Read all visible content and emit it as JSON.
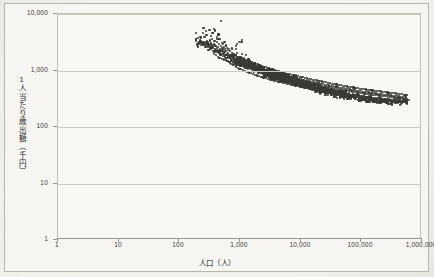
{
  "chart_data": {
    "type": "scatter",
    "title": "",
    "xlabel": "人口（人）",
    "ylabel": "1人当たり歳出額（千円）",
    "xscale": "log",
    "yscale": "log",
    "xlim": [
      1,
      1000000
    ],
    "ylim": [
      1,
      10000
    ],
    "grid": true,
    "legend": "none",
    "marker_color": "#3a3936",
    "plot_background": "#f9f8f4",
    "gridline_color": "#cfcbc2",
    "xticks": [
      "1",
      "10",
      "100",
      "1,000",
      "10,000",
      "100,000",
      "1,000,000"
    ],
    "xtick_values": [
      1,
      10,
      100,
      1000,
      10000,
      100000,
      1000000
    ],
    "yticks": [
      "1",
      "10",
      "100",
      "1,000",
      "10,000"
    ],
    "ytick_values": [
      1,
      10,
      100,
      1000,
      10000
    ],
    "point_count": 1750,
    "trend": {
      "x_points": [
        180,
        400,
        1000,
        3000,
        10000,
        30000,
        100000,
        300000,
        600000
      ],
      "y_points": [
        3600,
        2400,
        1450,
        900,
        600,
        420,
        320,
        275,
        290
      ]
    },
    "points": [
      [
        186,
        4600
      ],
      [
        212,
        2950
      ],
      [
        232,
        3050
      ],
      [
        252,
        3900
      ],
      [
        268,
        2880
      ],
      [
        281,
        4250
      ],
      [
        292,
        3180
      ],
      [
        300,
        2600
      ],
      [
        311,
        5250
      ],
      [
        318,
        3400
      ],
      [
        326,
        2420
      ],
      [
        334,
        4050
      ],
      [
        341,
        2780
      ],
      [
        349,
        3560
      ],
      [
        356,
        2180
      ],
      [
        362,
        4600
      ],
      [
        369,
        2950
      ],
      [
        375,
        1980
      ],
      [
        381,
        3350
      ],
      [
        388,
        5100
      ],
      [
        394,
        2300
      ],
      [
        400,
        2750
      ],
      [
        406,
        1870
      ],
      [
        412,
        3900
      ],
      [
        418,
        2480
      ],
      [
        424,
        3150
      ],
      [
        430,
        1760
      ],
      [
        436,
        2620
      ],
      [
        442,
        4350
      ],
      [
        448,
        2080
      ],
      [
        454,
        2900
      ],
      [
        460,
        1680
      ],
      [
        466,
        2350
      ],
      [
        472,
        3600
      ],
      [
        478,
        1920
      ],
      [
        484,
        2700
      ],
      [
        490,
        7450
      ],
      [
        496,
        2220
      ],
      [
        502,
        1620
      ],
      [
        508,
        3050
      ],
      [
        514,
        2480
      ],
      [
        520,
        1820
      ],
      [
        526,
        2900
      ],
      [
        532,
        2150
      ],
      [
        538,
        1560
      ],
      [
        544,
        2620
      ],
      [
        550,
        1980
      ],
      [
        556,
        3200
      ],
      [
        562,
        1720
      ],
      [
        568,
        2380
      ],
      [
        574,
        1880
      ],
      [
        580,
        2760
      ],
      [
        586,
        1520
      ],
      [
        592,
        2180
      ],
      [
        598,
        1680
      ],
      [
        604,
        2520
      ],
      [
        612,
        1920
      ],
      [
        620,
        1480
      ],
      [
        628,
        2280
      ],
      [
        636,
        1760
      ],
      [
        644,
        2050
      ],
      [
        652,
        1420
      ],
      [
        660,
        2420
      ],
      [
        668,
        1640
      ],
      [
        676,
        1880
      ],
      [
        684,
        1380
      ],
      [
        692,
        2180
      ],
      [
        700,
        1560
      ],
      [
        710,
        1800
      ],
      [
        720,
        1320
      ],
      [
        730,
        2050
      ],
      [
        740,
        1480
      ],
      [
        750,
        1720
      ],
      [
        760,
        1280
      ],
      [
        772,
        1950
      ],
      [
        784,
        1420
      ],
      [
        796,
        1660
      ],
      [
        808,
        1240
      ],
      [
        820,
        1880
      ],
      [
        832,
        1380
      ],
      [
        845,
        1600
      ],
      [
        858,
        1180
      ],
      [
        872,
        1820
      ],
      [
        886,
        1340
      ],
      [
        900,
        1540
      ],
      [
        915,
        1120
      ],
      [
        930,
        1760
      ],
      [
        946,
        1300
      ],
      [
        962,
        1480
      ],
      [
        978,
        1080
      ],
      [
        995,
        1700
      ],
      [
        1012,
        1260
      ],
      [
        1030,
        1440
      ],
      [
        1048,
        1050
      ],
      [
        1067,
        1640
      ],
      [
        1086,
        1220
      ],
      [
        1106,
        1400
      ],
      [
        1126,
        1010
      ],
      [
        1147,
        1580
      ],
      [
        1168,
        1180
      ],
      [
        1190,
        1360
      ],
      [
        1212,
        980
      ],
      [
        1235,
        1520
      ],
      [
        1258,
        1150
      ],
      [
        1282,
        1320
      ],
      [
        1306,
        950
      ],
      [
        1331,
        1480
      ],
      [
        1356,
        1120
      ],
      [
        1382,
        1280
      ],
      [
        1409,
        920
      ],
      [
        1436,
        1440
      ],
      [
        1464,
        1090
      ],
      [
        1492,
        1250
      ],
      [
        1521,
        890
      ],
      [
        1551,
        1400
      ],
      [
        1581,
        1060
      ],
      [
        1612,
        1210
      ],
      [
        1644,
        865
      ],
      [
        1676,
        1360
      ],
      [
        1709,
        1030
      ],
      [
        1743,
        1180
      ],
      [
        1778,
        840
      ],
      [
        1813,
        1320
      ],
      [
        1849,
        1000
      ],
      [
        1886,
        1150
      ],
      [
        1924,
        815
      ],
      [
        1962,
        1280
      ],
      [
        2001,
        975
      ],
      [
        2042,
        1120
      ],
      [
        2083,
        790
      ],
      [
        2125,
        1240
      ],
      [
        2168,
        950
      ],
      [
        2212,
        1090
      ],
      [
        2256,
        770
      ],
      [
        2302,
        1200
      ],
      [
        2349,
        925
      ],
      [
        2396,
        1060
      ],
      [
        2445,
        750
      ],
      [
        2495,
        1170
      ],
      [
        2545,
        900
      ],
      [
        2597,
        1030
      ],
      [
        2650,
        730
      ],
      [
        2704,
        1140
      ],
      [
        2759,
        880
      ],
      [
        2815,
        1000
      ],
      [
        2873,
        710
      ],
      [
        2931,
        1110
      ],
      [
        2991,
        860
      ],
      [
        3052,
        975
      ],
      [
        3114,
        695
      ],
      [
        3178,
        1080
      ],
      [
        3243,
        840
      ],
      [
        3309,
        950
      ],
      [
        3376,
        680
      ],
      [
        3445,
        1050
      ],
      [
        3516,
        820
      ],
      [
        3588,
        925
      ],
      [
        3661,
        665
      ],
      [
        3736,
        1020
      ],
      [
        3812,
        800
      ],
      [
        3890,
        900
      ],
      [
        3970,
        650
      ],
      [
        4051,
        995
      ],
      [
        4134,
        785
      ],
      [
        4219,
        875
      ],
      [
        4305,
        635
      ],
      [
        4393,
        970
      ],
      [
        4483,
        765
      ],
      [
        4575,
        855
      ],
      [
        4669,
        622
      ],
      [
        4765,
        945
      ],
      [
        4862,
        750
      ],
      [
        4962,
        835
      ],
      [
        5064,
        610
      ],
      [
        5167,
        920
      ],
      [
        5273,
        735
      ],
      [
        5381,
        815
      ],
      [
        5491,
        598
      ],
      [
        5604,
        900
      ],
      [
        5718,
        720
      ],
      [
        5836,
        795
      ],
      [
        5955,
        585
      ],
      [
        6077,
        880
      ],
      [
        6202,
        705
      ],
      [
        6329,
        778
      ],
      [
        6459,
        575
      ],
      [
        6591,
        860
      ],
      [
        6726,
        692
      ],
      [
        6864,
        760
      ],
      [
        7005,
        563
      ],
      [
        7148,
        842
      ],
      [
        7295,
        678
      ],
      [
        7444,
        745
      ],
      [
        7597,
        552
      ],
      [
        7752,
        825
      ],
      [
        7911,
        665
      ],
      [
        8073,
        730
      ],
      [
        8238,
        542
      ],
      [
        8407,
        808
      ],
      [
        8579,
        652
      ],
      [
        8754,
        715
      ],
      [
        8933,
        532
      ],
      [
        9116,
        790
      ],
      [
        9302,
        640
      ],
      [
        9492,
        700
      ],
      [
        9686,
        522
      ],
      [
        9884,
        775
      ],
      [
        10086,
        628
      ],
      [
        10292,
        688
      ],
      [
        10502,
        512
      ],
      [
        10716,
        760
      ],
      [
        10935,
        617
      ],
      [
        11158,
        675
      ],
      [
        11385,
        503
      ],
      [
        11617,
        745
      ],
      [
        11854,
        605
      ],
      [
        12096,
        662
      ],
      [
        12342,
        494
      ],
      [
        12594,
        730
      ],
      [
        12850,
        595
      ],
      [
        13112,
        650
      ],
      [
        13379,
        486
      ],
      [
        13652,
        716
      ],
      [
        13930,
        584
      ],
      [
        14214,
        638
      ],
      [
        14503,
        478
      ],
      [
        14799,
        702
      ],
      [
        15100,
        574
      ],
      [
        15408,
        626
      ],
      [
        15722,
        470
      ],
      [
        16042,
        690
      ],
      [
        16369,
        564
      ],
      [
        16703,
        615
      ],
      [
        17043,
        462
      ],
      [
        17390,
        676
      ],
      [
        17745,
        554
      ],
      [
        18106,
        604
      ],
      [
        18475,
        455
      ],
      [
        18852,
        664
      ],
      [
        19236,
        545
      ],
      [
        19628,
        593
      ],
      [
        20028,
        448
      ],
      [
        20436,
        652
      ],
      [
        20852,
        536
      ],
      [
        21277,
        582
      ],
      [
        21710,
        441
      ],
      [
        22152,
        640
      ],
      [
        22603,
        527
      ],
      [
        23063,
        572
      ],
      [
        23533,
        434
      ],
      [
        24012,
        628
      ],
      [
        24500,
        518
      ],
      [
        24999,
        562
      ],
      [
        25507,
        428
      ],
      [
        26026,
        617
      ],
      [
        26556,
        510
      ],
      [
        27096,
        552
      ],
      [
        27647,
        422
      ],
      [
        28210,
        606
      ],
      [
        28784,
        502
      ],
      [
        29369,
        542
      ],
      [
        29967,
        416
      ],
      [
        30577,
        595
      ],
      [
        31199,
        494
      ],
      [
        31834,
        533
      ],
      [
        32482,
        410
      ],
      [
        33143,
        585
      ],
      [
        33818,
        486
      ],
      [
        34506,
        524
      ],
      [
        35208,
        405
      ],
      [
        35925,
        575
      ],
      [
        36656,
        478
      ],
      [
        37402,
        515
      ],
      [
        38163,
        399
      ],
      [
        38940,
        565
      ],
      [
        39733,
        471
      ],
      [
        40541,
        506
      ],
      [
        41366,
        394
      ],
      [
        42208,
        556
      ],
      [
        43067,
        464
      ],
      [
        43944,
        498
      ],
      [
        44838,
        389
      ],
      [
        45751,
        547
      ],
      [
        46682,
        457
      ],
      [
        47632,
        490
      ],
      [
        48601,
        384
      ],
      [
        49590,
        538
      ],
      [
        50599,
        450
      ],
      [
        51629,
        482
      ],
      [
        52679,
        380
      ],
      [
        53751,
        530
      ],
      [
        54845,
        443
      ],
      [
        55961,
        474
      ],
      [
        57100,
        375
      ],
      [
        58262,
        522
      ],
      [
        59448,
        437
      ],
      [
        60657,
        467
      ],
      [
        61892,
        371
      ],
      [
        63152,
        514
      ],
      [
        64437,
        431
      ],
      [
        65749,
        460
      ],
      [
        67087,
        367
      ],
      [
        68453,
        506
      ],
      [
        69847,
        425
      ],
      [
        71269,
        453
      ],
      [
        72720,
        363
      ],
      [
        74201,
        499
      ],
      [
        75712,
        419
      ],
      [
        77254,
        446
      ],
      [
        78827,
        359
      ],
      [
        80433,
        492
      ],
      [
        82071,
        413
      ],
      [
        83743,
        440
      ],
      [
        85448,
        355
      ],
      [
        87189,
        485
      ],
      [
        88965,
        408
      ],
      [
        90777,
        434
      ],
      [
        92625,
        351
      ],
      [
        94512,
        478
      ],
      [
        96436,
        402
      ],
      [
        98400,
        428
      ],
      [
        100403,
        348
      ],
      [
        102448,
        472
      ],
      [
        104533,
        397
      ],
      [
        106661,
        422
      ],
      [
        108832,
        344
      ],
      [
        111047,
        466
      ],
      [
        113307,
        392
      ],
      [
        115613,
        417
      ],
      [
        117966,
        341
      ],
      [
        120366,
        460
      ],
      [
        122816,
        387
      ],
      [
        125315,
        412
      ],
      [
        127865,
        338
      ],
      [
        130467,
        455
      ],
      [
        133122,
        382
      ],
      [
        135831,
        407
      ],
      [
        138595,
        334
      ],
      [
        141415,
        449
      ],
      [
        144293,
        377
      ],
      [
        147229,
        402
      ],
      [
        150225,
        331
      ],
      [
        153282,
        444
      ],
      [
        156401,
        373
      ],
      [
        159584,
        397
      ],
      [
        162832,
        328
      ],
      [
        166146,
        439
      ],
      [
        169527,
        368
      ],
      [
        172977,
        392
      ],
      [
        176497,
        325
      ],
      [
        180089,
        434
      ],
      [
        183754,
        364
      ],
      [
        187493,
        388
      ],
      [
        191308,
        322
      ],
      [
        195201,
        429
      ],
      [
        199173,
        360
      ],
      [
        203225,
        383
      ],
      [
        207360,
        319
      ],
      [
        211579,
        424
      ],
      [
        215883,
        356
      ],
      [
        220275,
        378
      ],
      [
        224755,
        316
      ],
      [
        229327,
        419
      ],
      [
        233991,
        352
      ],
      [
        238750,
        374
      ],
      [
        243606,
        313
      ],
      [
        248560,
        414
      ],
      [
        253615,
        348
      ],
      [
        258772,
        370
      ],
      [
        264034,
        310
      ],
      [
        269403,
        409
      ],
      [
        274881,
        344
      ],
      [
        280470,
        366
      ],
      [
        286173,
        307
      ],
      [
        291992,
        405
      ],
      [
        297929,
        340
      ],
      [
        303986,
        362
      ],
      [
        310167,
        305
      ],
      [
        316473,
        400
      ],
      [
        322907,
        336
      ],
      [
        329472,
        358
      ],
      [
        336170,
        302
      ],
      [
        343004,
        396
      ],
      [
        349977,
        332
      ],
      [
        357092,
        354
      ],
      [
        364351,
        299
      ],
      [
        371758,
        391
      ],
      [
        379316,
        328
      ],
      [
        387027,
        350
      ],
      [
        394895,
        297
      ],
      [
        402923,
        387
      ],
      [
        411114,
        325
      ],
      [
        419471,
        346
      ],
      [
        427998,
        294
      ],
      [
        436699,
        382
      ],
      [
        445576,
        321
      ],
      [
        454634,
        342
      ],
      [
        463876,
        292
      ],
      [
        473305,
        378
      ],
      [
        482926,
        318
      ],
      [
        492742,
        338
      ],
      [
        502758,
        289
      ],
      [
        512977,
        374
      ],
      [
        523404,
        314
      ],
      [
        534043,
        334
      ],
      [
        544898,
        287
      ],
      [
        555973,
        370
      ],
      [
        567274,
        311
      ]
    ]
  }
}
